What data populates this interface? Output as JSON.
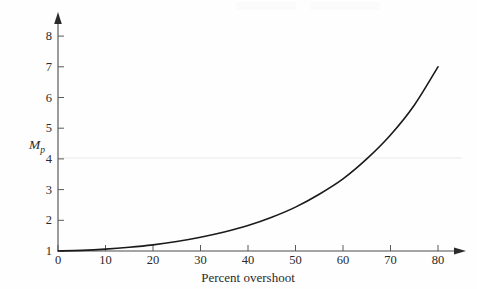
{
  "chart_data": {
    "type": "line",
    "title": "",
    "subtitle": "",
    "xlabel": "Percent overshoot",
    "ylabel": "M_p",
    "ylabel_display": "M",
    "ylabel_subscript": "p",
    "xlim": [
      0,
      85
    ],
    "ylim": [
      1,
      8.5
    ],
    "xticks": [
      0,
      10,
      20,
      30,
      40,
      50,
      60,
      70,
      80
    ],
    "yticks": [
      1,
      2,
      3,
      4,
      5,
      6,
      7,
      8
    ],
    "xtick_labels": [
      "0",
      "10",
      "20",
      "30",
      "40",
      "50",
      "60",
      "70",
      "80"
    ],
    "ytick_labels": [
      "1",
      "2",
      "3",
      "4",
      "5",
      "6",
      "7",
      "8"
    ],
    "grid": false,
    "legend": null,
    "legend_position": "none",
    "axis_style": "arrow-tipped",
    "series": [
      {
        "name": "Mp vs percent overshoot",
        "color": "#1a1a1a",
        "linewidth": 1.6,
        "x": [
          0,
          5,
          10,
          15,
          20,
          25,
          30,
          35,
          40,
          45,
          50,
          55,
          60,
          65,
          70,
          75,
          80
        ],
        "y": [
          1.0,
          1.02,
          1.06,
          1.12,
          1.2,
          1.31,
          1.45,
          1.62,
          1.83,
          2.1,
          2.43,
          2.85,
          3.35,
          4.0,
          4.78,
          5.75,
          7.0
        ]
      }
    ],
    "annotations": []
  },
  "axes_geometry": {
    "x_origin_px": 58,
    "y_origin_px": 251,
    "px_per_x_unit": 4.75,
    "px_per_y_unit": 30.7,
    "x_axis_end_px": 466,
    "y_axis_end_px": 14
  },
  "colors": {
    "curve": "#1a1a1a",
    "axis": "#4a4a4a",
    "tick_label": "#2a2a2a",
    "background": "#fefefe",
    "scan_artifact": "#f4f4f4"
  }
}
